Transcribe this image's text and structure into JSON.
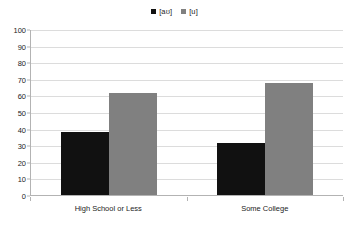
{
  "chart_data": {
    "type": "bar",
    "title": "",
    "subtitle": "",
    "xlabel": "",
    "ylabel": "",
    "categories": [
      "High School or Less",
      "Some College"
    ],
    "series": [
      {
        "name": "[aʊ]",
        "color": "#111111",
        "values": [
          38,
          31.5
        ]
      },
      {
        "name": "[u]",
        "color": "#808080",
        "values": [
          61.5,
          67.5
        ]
      }
    ],
    "ylim": [
      0,
      100
    ],
    "ytick_step": 10,
    "yticks": [
      100,
      90,
      80,
      70,
      60,
      50,
      40,
      30,
      20,
      10,
      0
    ],
    "ytick_labels": [
      "100",
      "90",
      "80",
      "70",
      "60",
      "50",
      "40",
      "30",
      "20",
      "10",
      "0"
    ],
    "grid": true,
    "grid_axis": "y",
    "legend_position": "top-center",
    "annotations": []
  },
  "style": {
    "background": "#ffffff",
    "gridline_color": "#dcdcdc",
    "axis_color": "#b3b3b3",
    "text_color": "#1c1c1c"
  }
}
